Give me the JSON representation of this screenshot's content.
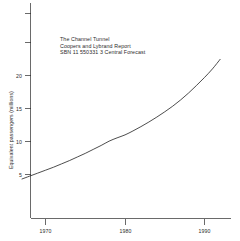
{
  "chart_data": {
    "type": "line",
    "title": "",
    "xlabel": "",
    "ylabel": "Equivalent passengers (millions)",
    "xlim": [
      1966.5,
      1993.0
    ],
    "ylim": [
      0,
      26
    ],
    "grid": false,
    "legend": false,
    "xticks": [
      1970,
      1980,
      1990
    ],
    "xtick_labels": [
      "1970",
      "1980",
      "1990"
    ],
    "yticks": [
      5,
      10,
      15,
      20,
      25
    ],
    "ytick_labels": [
      "5",
      "10",
      "15",
      "20",
      ""
    ],
    "series": [
      {
        "name": "Central Forecast",
        "x": [
          1967,
          1968,
          1969,
          1970,
          1971,
          1972,
          1973,
          1974,
          1975,
          1976,
          1977,
          1978,
          1979,
          1980,
          1981,
          1982,
          1983,
          1984,
          1985,
          1986,
          1987,
          1988,
          1989,
          1990,
          1991,
          1992
        ],
        "values": [
          4.3,
          4.75,
          5.2,
          5.65,
          6.1,
          6.6,
          7.1,
          7.65,
          8.2,
          8.8,
          9.4,
          10.05,
          10.55,
          11.0,
          11.6,
          12.25,
          12.95,
          13.7,
          14.5,
          15.35,
          16.3,
          17.35,
          18.5,
          19.7,
          21.0,
          22.5
        ]
      }
    ],
    "annotations": [
      "The Channel Tunnel",
      "Coopers and Lybrand Report",
      "SBN 11 550331 3 Central Forecast"
    ]
  },
  "colors": {
    "curve": "#1f1f1f",
    "axis": "#2b2b2b",
    "background": "#ffffff"
  }
}
